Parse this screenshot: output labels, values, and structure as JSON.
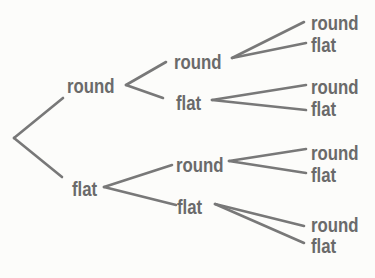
{
  "figure": {
    "kind": "tree-diagram",
    "background_color": "#fcfcfa",
    "line_color": "#787878",
    "text_color": "#6a6a6a"
  },
  "tree": {
    "levels": 3,
    "root": {
      "children": [
        {
          "label": "round",
          "children": [
            {
              "label": "round",
              "children": [
                {
                  "label": "round"
                },
                {
                  "label": "flat"
                }
              ]
            },
            {
              "label": "flat",
              "children": [
                {
                  "label": "round"
                },
                {
                  "label": "flat"
                }
              ]
            }
          ]
        },
        {
          "label": "flat",
          "children": [
            {
              "label": "round",
              "children": [
                {
                  "label": "round"
                },
                {
                  "label": "flat"
                }
              ]
            },
            {
              "label": "flat",
              "children": [
                {
                  "label": "round"
                },
                {
                  "label": "flat"
                }
              ]
            }
          ]
        }
      ]
    }
  }
}
